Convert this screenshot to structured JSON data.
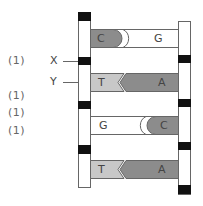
{
  "marks": [
    "(1)",
    "(1)",
    "(1)",
    "(1)"
  ],
  "labels": {
    "x": "X",
    "y": "Y"
  },
  "colors": {
    "purine_dark": "#8c8c8c",
    "pyrimidine_light": "#c8c8c8",
    "white_base": "#ffffff",
    "phosphate_block": "#111111",
    "outline": "#666666"
  },
  "base_pairs": [
    {
      "left": "C",
      "right": "G",
      "bond": "rounded"
    },
    {
      "left": "T",
      "right": "A",
      "bond": "chevron"
    },
    {
      "left": "G",
      "right": "C",
      "bond": "rounded"
    },
    {
      "left": "T",
      "right": "A",
      "bond": "chevron"
    }
  ]
}
